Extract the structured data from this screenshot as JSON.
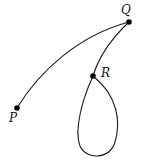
{
  "diagram": {
    "type": "curve-path",
    "stroke_color": "#1a1a1a",
    "point_color": "#000000",
    "points": [
      {
        "id": "P",
        "label": "P",
        "x": 17,
        "y": 108
      },
      {
        "id": "Q",
        "label": "Q",
        "x": 129,
        "y": 22
      },
      {
        "id": "R",
        "label": "R",
        "x": 93,
        "y": 76
      }
    ],
    "segments": [
      {
        "from": "P",
        "to": "Q",
        "shape": "arc"
      },
      {
        "from": "Q",
        "to": "R",
        "shape": "arc"
      },
      {
        "from": "R",
        "to": "R",
        "shape": "loop"
      }
    ]
  }
}
